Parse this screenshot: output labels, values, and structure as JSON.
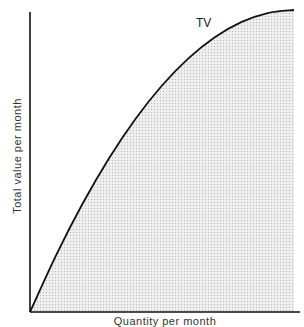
{
  "chart_data": {
    "type": "area",
    "title": "",
    "xlabel": "Quantity per month",
    "ylabel": "Total value per month",
    "series": [
      {
        "name": "TV",
        "x": [
          0,
          0.1,
          0.2,
          0.3,
          0.4,
          0.5,
          0.6,
          0.7,
          0.8,
          0.9,
          1.0
        ],
        "values": [
          0,
          0.19,
          0.36,
          0.51,
          0.64,
          0.75,
          0.84,
          0.91,
          0.96,
          0.99,
          1.0
        ]
      }
    ],
    "annotations": [
      "TV"
    ],
    "grid": false,
    "legend": "none",
    "fill": "stippled gray under curve",
    "xlim": [
      0,
      1
    ],
    "ylim": [
      0,
      1
    ]
  },
  "labels": {
    "y_axis": "Total value per month",
    "x_axis": "Quantity per month",
    "curve": "TV"
  },
  "colors": {
    "axis": "#111111",
    "curve": "#111111",
    "fill": "#e6e6e6"
  }
}
